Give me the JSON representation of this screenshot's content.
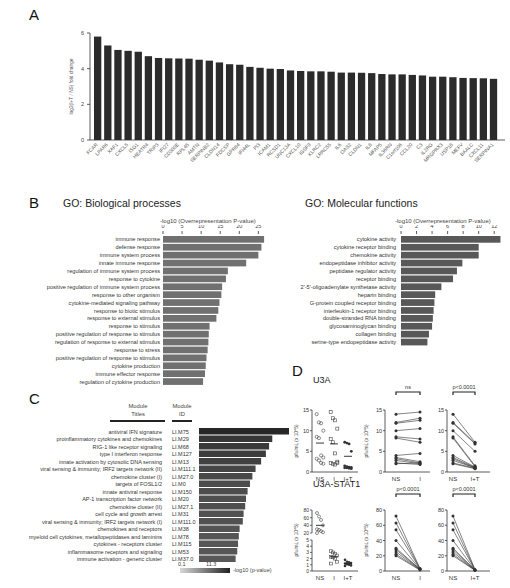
{
  "panels": {
    "A": {
      "letter": "A"
    },
    "B": {
      "letter": "B",
      "left_title": "GO: Biological processes",
      "right_title": "GO: Molecular functions",
      "axis_label": "-log10 (Overrepresentation P-value)"
    },
    "C": {
      "letter": "C",
      "col1_header_line1": "Module",
      "col1_header_line2": "Titles",
      "col2_header_line1": "Module",
      "col2_header_line2": "ID",
      "legend_min": "0.1",
      "legend_max": "11.3",
      "legend_label": "-log10 (p-value)"
    },
    "D": {
      "letter": "D",
      "row1_title": "U3A",
      "row2_title": "U3A-STAT1",
      "ylabel": "pfu/mL (x 10^5)",
      "ns_label": "ns",
      "p1": "p<0.0001",
      "p2": "p<0.0001",
      "p3": "p<0.0001",
      "p4": "p<0.0001"
    }
  },
  "chart_data": [
    {
      "id": "A",
      "type": "bar",
      "title": "",
      "xlabel": "",
      "ylabel": "log2(I+T / NS) fold change",
      "ylim": [
        0,
        6
      ],
      "yticks": [
        0,
        2,
        4,
        6
      ],
      "categories": [
        "FCAR",
        "LPAR6",
        "XAF1",
        "CXCL5",
        "ISG1",
        "HEATR4",
        "TRIP3",
        "IFI27",
        "CD300E",
        "RPL45",
        "AMTN",
        "SERPINB2",
        "CLDN14",
        "FDCSP",
        "GPR84",
        "IFI44L",
        "PI3",
        "ICAM1",
        "RCSD1",
        "UNC13A",
        "CXCL10",
        "IGSF9",
        "KLRC2",
        "LRRC55",
        "IL6",
        "OAS2",
        "CLDN1",
        "IL8",
        "MFAP5",
        "IL36RN",
        "C1orf106",
        "CCL20",
        "C3",
        "IL2RG",
        "MRGPRX3",
        "USP18",
        "MEFV",
        "BAALC",
        "CXCL11",
        "SERPINA1"
      ],
      "values": [
        5.8,
        5.3,
        5.05,
        5.0,
        4.95,
        4.7,
        4.6,
        4.58,
        4.57,
        4.56,
        4.5,
        4.45,
        4.35,
        4.25,
        4.22,
        4.1,
        4.05,
        4.0,
        3.98,
        3.9,
        3.87,
        3.85,
        3.85,
        3.83,
        3.78,
        3.78,
        3.77,
        3.75,
        3.7,
        3.68,
        3.68,
        3.65,
        3.62,
        3.55,
        3.55,
        3.52,
        3.48,
        3.47,
        3.46,
        3.43
      ]
    },
    {
      "id": "B-bio",
      "type": "bar",
      "orientation": "horizontal",
      "title": "GO: Biological processes",
      "xlabel": "-log10 (Overrepresentation P-value)",
      "xlim": [
        0,
        27
      ],
      "xticks": [
        0,
        5,
        10,
        15,
        20,
        25
      ],
      "categories": [
        "immune response",
        "defense response",
        "immune system process",
        "innate immune response",
        "regulation of immune system process",
        "response to cytokine",
        "positive regulation of immune system process",
        "response to other organism",
        "cytokine-mediated signaling pathway",
        "response to biotic stimulus",
        "response to external stimulus",
        "response to stimulus",
        "positive regulation of response to stimulus",
        "regulation of response to external stimulus",
        "response to stress",
        "positive regulation of response to stimulus",
        "cytokine production",
        "immune effector response",
        "regulation of cytokine production"
      ],
      "values": [
        26.5,
        25.8,
        25.0,
        21.8,
        17.0,
        16.5,
        15.5,
        15.3,
        14.8,
        14.5,
        14.0,
        12.2,
        12.0,
        11.9,
        11.7,
        11.4,
        11.2,
        11.0,
        10.5
      ]
    },
    {
      "id": "B-mol",
      "type": "bar",
      "orientation": "horizontal",
      "title": "GO: Molecular functions",
      "xlabel": "-log10 (Overrepresentation P-value)",
      "xlim": [
        0,
        13
      ],
      "xticks": [
        0,
        2,
        4,
        6,
        8,
        10,
        12
      ],
      "categories": [
        "cytokine activity",
        "cytokine receptor binding",
        "chemokine activity",
        "endopeptidase inhibitor activity",
        "peptidase regulator activity",
        "receptor binding",
        "2'-5'-oligoadenylate synthetase activity",
        "heparin binding",
        "G-protein coupled receptor binding",
        "interleukin-1 receptor binding",
        "double-stranded RNA binding",
        "glycosaminoglycan binding",
        "collagen binding",
        "serine-type endopeptidase activity"
      ],
      "values": [
        12.8,
        10.0,
        10.0,
        7.9,
        7.2,
        6.7,
        5.2,
        4.4,
        4.3,
        4.2,
        4.1,
        4.0,
        3.6,
        3.4
      ]
    },
    {
      "id": "C",
      "type": "bar",
      "orientation": "horizontal",
      "title": "",
      "xlabel": "-log10 (p-value)",
      "colorscale": [
        0.1,
        11.3
      ],
      "categories": [
        "antiviral IFN signature",
        "proinflammatory cytokines and chemokines",
        "RIG-1 like receptor signaling",
        "type I interferon response",
        "innate activation by cytosolic DNA sensing",
        "viral sensing & immunity; IRF2 targets network (II)",
        "chemokine cluster (I)",
        "targets of FOSL1/2",
        "innate antiviral response",
        "AP-1 transcription factor network",
        "chemokine cluster (II)",
        "cell cycle and growth arrest",
        "viral sensing & immunity; IRF2 targets network (I)",
        "chemokines and receptors",
        "myeloid cell cytokines, metallopeptidases and laminins",
        "cytokines - receptors cluster",
        "inflammasome receptors and signaling",
        "immune activation - generic cluster"
      ],
      "module_ids": [
        "LI.M75",
        "LI.M29",
        "LI.M68",
        "LI.M127",
        "LI.M13",
        "LI.M111.1",
        "LI.M27.0",
        "LI.M0",
        "LI.M150",
        "LI.M20",
        "LI.M27.1",
        "LI.M31",
        "LI.M111.0",
        "LI.M38",
        "LI.M78",
        "LI.M115",
        "LI.M53",
        "LI.M37.0"
      ],
      "values": [
        11.3,
        9.2,
        8.8,
        8.4,
        7.8,
        7.1,
        6.7,
        6.4,
        6.1,
        5.9,
        5.8,
        5.6,
        5.5,
        5.1,
        5.0,
        4.9,
        4.8,
        4.6
      ]
    },
    {
      "id": "D-U3A",
      "type": "scatter",
      "title": "U3A",
      "ylabel": "pfu/mL (x 10^5)",
      "ylim": [
        0,
        15
      ],
      "yticks": [
        0,
        5,
        10,
        15
      ],
      "categories": [
        "NS",
        "I",
        "I+T"
      ],
      "series": [
        {
          "name": "NS",
          "values": [
            14,
            12,
            11.8,
            10,
            8.5,
            8.2,
            4,
            3.5,
            3.2,
            2.8,
            2.2,
            2
          ],
          "mean": 7.0
        },
        {
          "name": "I",
          "values": [
            14.5,
            13,
            12.5,
            10.5,
            8,
            7.2,
            4.5,
            2.5,
            2.2,
            2,
            1.8,
            2.2
          ],
          "mean": 6.8
        },
        {
          "name": "I+T",
          "values": [
            7.2,
            7,
            6.8,
            5,
            1.5,
            1.3,
            1.2,
            1.1,
            1,
            1,
            0.9,
            0.8
          ],
          "mean": 3.8
        }
      ],
      "comparisons": [
        {
          "pair": [
            "NS",
            "I"
          ],
          "label": "ns"
        },
        {
          "pair": [
            "NS",
            "I+T"
          ],
          "label": "p<0.0001"
        }
      ]
    },
    {
      "id": "D-U3A-STAT1",
      "type": "scatter",
      "title": "U3A-STAT1",
      "ylabel": "pfu/mL (x 10^5)",
      "ylim": [
        0,
        80
      ],
      "yticks": [
        0,
        20,
        40,
        60,
        80
      ],
      "categories": [
        "NS",
        "I",
        "I+T"
      ],
      "series": [
        {
          "name": "NS",
          "values": [
            72,
            63,
            54,
            40,
            30,
            28,
            25,
            22,
            20
          ],
          "mean": 40
        },
        {
          "name": "I",
          "values": [
            3.2,
            3.0,
            2.8,
            2.5,
            2.3,
            2.2,
            2.0,
            1.5,
            1.2
          ],
          "mean": 2.3
        },
        {
          "name": "I+T",
          "values": [
            1.8,
            1.5,
            1.4,
            1.3,
            1.2,
            1.1,
            1.0,
            0.9,
            0.8
          ],
          "mean": 1.2
        }
      ],
      "comparisons": [
        {
          "pair": [
            "NS",
            "I"
          ],
          "label": "p<0.0001"
        },
        {
          "pair": [
            "NS",
            "I+T"
          ],
          "label": "p<0.0001"
        }
      ]
    }
  ]
}
